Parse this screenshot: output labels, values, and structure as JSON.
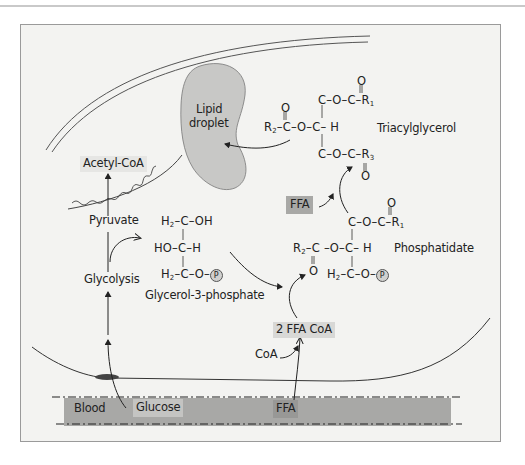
{
  "diagram": {
    "labels": {
      "lipid_droplet_line1": "Lipid",
      "lipid_droplet_line2": "droplet",
      "triacylglycerol": "Triacylglycerol",
      "acetyl_coa": "Acetyl-CoA",
      "pyruvate": "Pyruvate",
      "glycolysis": "Glycolysis",
      "glycerol_3_phosphate": "Glycerol-3-phosphate",
      "phosphatidate": "Phosphatidate",
      "ffa_top": "FFA",
      "two_ffa_coa": "2 FFA CoA",
      "coa": "CoA",
      "blood": "Blood",
      "glucose": "Glucose",
      "ffa_blood": "FFA"
    },
    "triacylglycerol_structure": {
      "top_row": "C–O–C–R",
      "top_sub": "1",
      "middle_prefix": "R",
      "middle_sub": "2",
      "middle_row": "–C–O–C– H",
      "bottom_row": "C–O–C–R",
      "bottom_sub": "3",
      "oxygen": "O"
    },
    "glycerol3p_structure": {
      "row1_prefix": "H",
      "row1_sub": "2",
      "row1": "–C–OH",
      "row2": "HO–C–H",
      "row3_prefix": "H",
      "row3_sub": "2",
      "row3": "–C–O–",
      "phosphate": "P"
    },
    "phosphatidate_structure": {
      "top_row": "C–O–C–R",
      "top_sub": "1",
      "middle_prefix": "R",
      "middle_sub": "2",
      "middle_row": "–C –O–C– H",
      "bottom_prefix": "H",
      "bottom_sub": "2",
      "bottom_row": "–C–O–",
      "phosphate": "P",
      "oxygen": "O"
    },
    "colors": {
      "background": "#f3f3f1",
      "droplet_fill": "#c8c8c6",
      "blood_band": "#a8a8a6",
      "label_box": "#d8d8d6",
      "line": "#333333"
    }
  }
}
